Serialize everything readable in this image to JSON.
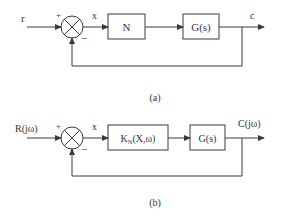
{
  "diagram_a": {
    "caption": "(a)",
    "input_label": "r",
    "plus_sign": "+",
    "minus_sign": "−",
    "error_label": "x",
    "block1_label": "N",
    "block2_label": "G(s)",
    "output_label": "c"
  },
  "diagram_b": {
    "caption": "(b)",
    "input_label": "R(jω)",
    "plus_sign": "+",
    "minus_sign": "−",
    "error_label": "x",
    "block1_label_main": "K",
    "block1_label_sub": "N",
    "block1_label_args": "(X,ω)",
    "block2_label": "G(s)",
    "output_label": "C(jω)"
  },
  "colors": {
    "line": "#3a3a3a",
    "text": "#333333",
    "background": "#ffffff"
  }
}
